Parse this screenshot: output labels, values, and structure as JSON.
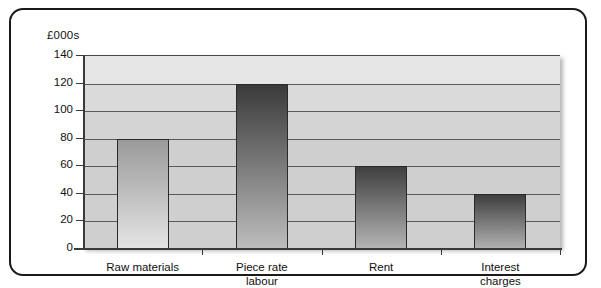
{
  "chart_data": {
    "type": "bar",
    "title": "",
    "subtitle": "",
    "xlabel": "",
    "ylabel": "£000s",
    "unit_label": "£000s",
    "categories": [
      "Raw materials",
      "Piece rate labour",
      "Rent",
      "Interest charges"
    ],
    "category_lines": [
      [
        "Raw materials"
      ],
      [
        "Piece rate",
        "labour"
      ],
      [
        "Rent"
      ],
      [
        "Interest",
        "charges"
      ]
    ],
    "values": [
      80,
      120,
      60,
      40
    ],
    "ylim": [
      0,
      140
    ],
    "ytick_step": 20,
    "yticks": [
      0,
      20,
      40,
      60,
      80,
      100,
      120,
      140
    ],
    "ytick_labels": [
      "0",
      "20",
      "40",
      "60",
      "80",
      "100",
      "120",
      "140"
    ],
    "grid": true,
    "legend": "none",
    "legend_position": "none",
    "bar_colors": [
      "#9a9a9a",
      "#3a3a3a",
      "#3f3f3f",
      "#3f3f3f"
    ],
    "bar_gradient_bottom": [
      "#e4e4e4",
      "#bdbdbd",
      "#b4b4b4",
      "#b0b0b0"
    ],
    "plot_background": "#d4d4d4",
    "border_color": "#1a1a1a",
    "axis_color": "#3a3a3a",
    "gridline_color": "#5a5a5a"
  }
}
